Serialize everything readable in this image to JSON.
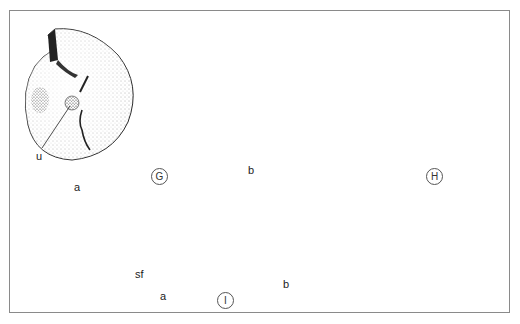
{
  "figure": {
    "type": "scientific-illustration-plate",
    "panels": [
      {
        "id": "G",
        "label": "G",
        "parts": [
          {
            "id": "a",
            "label": "a",
            "annotation": "u"
          },
          {
            "id": "b",
            "label": "b"
          }
        ]
      },
      {
        "id": "H",
        "label": "H"
      },
      {
        "id": "I",
        "label": "I",
        "parts": [
          {
            "id": "a",
            "label": "a",
            "annotation": "sf"
          },
          {
            "id": "b",
            "label": "b"
          }
        ]
      }
    ]
  },
  "labels": {
    "G_a": "a",
    "G_u": "u",
    "G_b": "b",
    "G_circle": "G",
    "H_circle": "H",
    "I_a": "a",
    "I_sf": "sf",
    "I_b": "b",
    "I_circle": "I"
  },
  "colors": {
    "ink": "#1a1a1a",
    "frame": "#8a8a8a",
    "background": "#ffffff"
  }
}
